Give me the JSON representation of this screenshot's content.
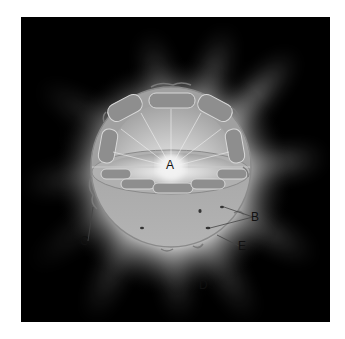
{
  "diagram": {
    "labels": {
      "A": "A",
      "B": "B",
      "C": "C",
      "D": "D",
      "E": "E"
    },
    "colors": {
      "background": "#000000",
      "corona": "#ffffff",
      "sphere": "#a8a8a8",
      "sphere_edge": "#8a8a8a",
      "label_text": "#111111"
    }
  }
}
